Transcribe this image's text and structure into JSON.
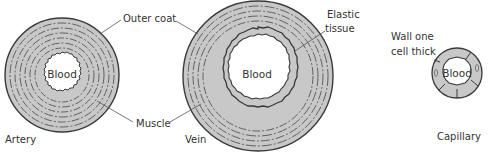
{
  "diagram": {
    "colors": {
      "wall_fill": "#c8c8c8",
      "line": "#3a3a3a",
      "text": "#333333",
      "background": "#ffffff"
    },
    "vessels": [
      {
        "id": "artery",
        "name": "Artery",
        "lumen_label": "Blood",
        "features": [
          "thick muscle wall",
          "narrow lumen"
        ]
      },
      {
        "id": "vein",
        "name": "Vein",
        "lumen_label": "Blood",
        "features": [
          "thinner muscle wall",
          "wide lumen",
          "elastic tissue"
        ]
      },
      {
        "id": "capillary",
        "name": "Capillary",
        "lumen_label": "Blood",
        "features": [
          "wall one cell thick"
        ]
      }
    ],
    "callouts": {
      "outer_coat": "Outer coat",
      "muscle": "Muscle",
      "elastic_tissue_line1": "Elastic",
      "elastic_tissue_line2": "tissue",
      "wall_line1": "Wall one",
      "wall_line2": "cell thick"
    }
  }
}
